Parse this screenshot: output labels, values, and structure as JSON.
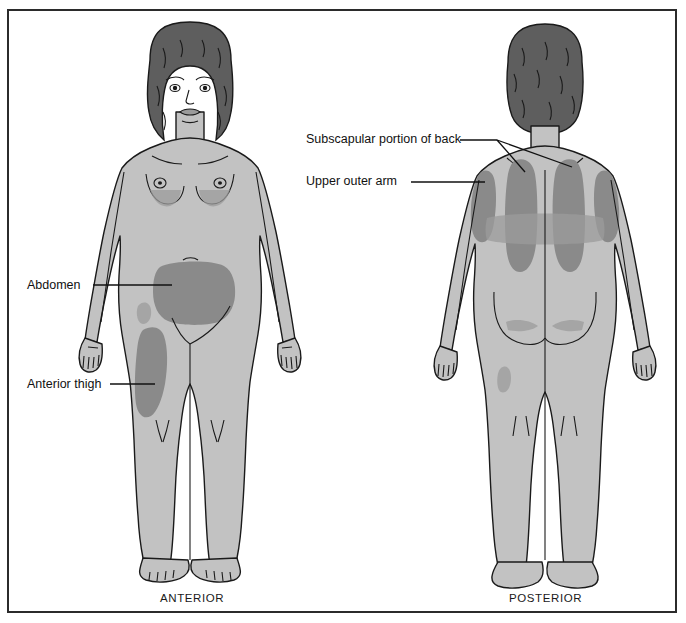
{
  "diagram": {
    "colors": {
      "frame_border": "#2b2b2b",
      "background": "#ffffff",
      "skin_fill": "#c2c2c2",
      "skin_light": "#cfcfcf",
      "shaded_site": "#8a8a8a",
      "shaded_site_soft": "#9a9a9a",
      "hair": "#5e5e5e",
      "outline": "#1a1a1a",
      "label_text": "#111111"
    },
    "views": [
      {
        "name": "anterior",
        "caption": "ANTERIOR",
        "sites": [
          {
            "id": "abdomen",
            "label": "Abdomen"
          },
          {
            "id": "anterior-thigh",
            "label": "Anterior thigh"
          }
        ]
      },
      {
        "name": "posterior",
        "caption": "POSTERIOR",
        "sites": [
          {
            "id": "subscapular",
            "label": "Subscapular portion of back"
          },
          {
            "id": "upper-outer-arm",
            "label": "Upper outer arm"
          }
        ]
      }
    ],
    "labels": {
      "abdomen": "Abdomen",
      "anterior_thigh": "Anterior thigh",
      "subscapular": "Subscapular portion of back",
      "upper_outer_arm": "Upper outer arm"
    },
    "captions": {
      "anterior": "ANTERIOR",
      "posterior": "POSTERIOR"
    }
  }
}
